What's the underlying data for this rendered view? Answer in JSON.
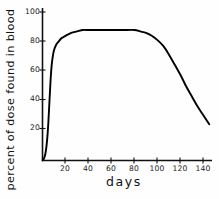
{
  "chart_data": {
    "type": "line",
    "title": "",
    "xlabel": "days",
    "ylabel": "percent of dose found in blood",
    "xlim": [
      0,
      148
    ],
    "ylim": [
      0,
      104
    ],
    "grid": false,
    "legend": null,
    "xticks": [
      20,
      40,
      60,
      80,
      100,
      120,
      140
    ],
    "xtick_labels": [
      "20",
      "40",
      "60",
      "80",
      "100",
      "120",
      "140"
    ],
    "yticks": [
      20,
      40,
      60,
      80,
      100
    ],
    "ytick_labels": [
      "20",
      "40",
      "60",
      "80",
      "100"
    ],
    "series": [
      {
        "name": "percent of dose found in blood",
        "color": "#000000",
        "x": [
          0,
          1,
          2,
          3,
          4,
          5,
          6,
          7,
          8,
          9,
          10,
          12,
          14,
          16,
          18,
          20,
          25,
          30,
          35,
          40,
          50,
          60,
          70,
          80,
          85,
          90,
          95,
          100,
          105,
          110,
          115,
          120,
          125,
          130,
          135,
          140,
          145
        ],
        "y": [
          0,
          1,
          3,
          7,
          14,
          25,
          40,
          55,
          66,
          72,
          76,
          80,
          82,
          84,
          85,
          86,
          88,
          89,
          90,
          90,
          90,
          90,
          90,
          90,
          89,
          88,
          86,
          83,
          79,
          73,
          66,
          59,
          51,
          44,
          37,
          31,
          25
        ]
      }
    ]
  },
  "axes": {
    "y_axis_name": "y-axis-line",
    "x_axis_name": "x-axis-line"
  }
}
